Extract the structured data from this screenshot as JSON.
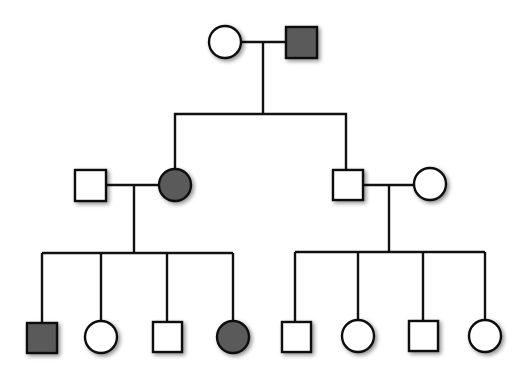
{
  "diagram": {
    "type": "pedigree",
    "colors": {
      "line": "#111111",
      "affected_fill": "#5a5a5a",
      "unaffected_fill": "#ffffff",
      "background": "#ffffff"
    },
    "legend": {
      "square": "male",
      "circle": "female",
      "shaded": "affected",
      "unshaded": "unaffected"
    },
    "generations": [
      {
        "label": "I",
        "individuals": [
          {
            "id": "I-1",
            "sex": "female",
            "affected": false
          },
          {
            "id": "I-2",
            "sex": "male",
            "affected": true
          }
        ]
      },
      {
        "label": "II",
        "individuals": [
          {
            "id": "II-1",
            "sex": "male",
            "affected": false,
            "note": "married in"
          },
          {
            "id": "II-2",
            "sex": "female",
            "affected": true,
            "parents": "I-1 x I-2"
          },
          {
            "id": "II-3",
            "sex": "male",
            "affected": false,
            "parents": "I-1 x I-2"
          },
          {
            "id": "II-4",
            "sex": "female",
            "affected": false,
            "note": "married in"
          }
        ]
      },
      {
        "label": "III",
        "individuals": [
          {
            "id": "III-1",
            "sex": "male",
            "affected": true,
            "parents": "II-1 x II-2"
          },
          {
            "id": "III-2",
            "sex": "female",
            "affected": false,
            "parents": "II-1 x II-2"
          },
          {
            "id": "III-3",
            "sex": "male",
            "affected": false,
            "parents": "II-1 x II-2"
          },
          {
            "id": "III-4",
            "sex": "female",
            "affected": true,
            "parents": "II-1 x II-2"
          },
          {
            "id": "III-5",
            "sex": "male",
            "affected": false,
            "parents": "II-3 x II-4"
          },
          {
            "id": "III-6",
            "sex": "female",
            "affected": false,
            "parents": "II-3 x II-4"
          },
          {
            "id": "III-7",
            "sex": "male",
            "affected": false,
            "parents": "II-3 x II-4"
          },
          {
            "id": "III-8",
            "sex": "female",
            "affected": false,
            "parents": "II-3 x II-4"
          }
        ]
      }
    ]
  }
}
